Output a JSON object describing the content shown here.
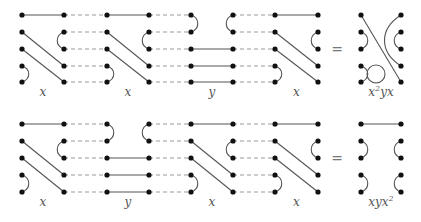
{
  "diagram": {
    "rows": [
      {
        "factors": [
          "x",
          "x",
          "y",
          "x"
        ],
        "equals": "=",
        "result": {
          "base": "x",
          "sup": "2",
          "rest": "yx",
          "label": "x²yx"
        }
      },
      {
        "factors": [
          "x",
          "y",
          "x",
          "x"
        ],
        "equals": "=",
        "result": {
          "base": "xyx",
          "sup": "2",
          "rest": "",
          "label": "xyx²"
        }
      }
    ],
    "colors": {
      "strand": "#555555",
      "dashed": "#999999",
      "dot": "#111111"
    }
  }
}
